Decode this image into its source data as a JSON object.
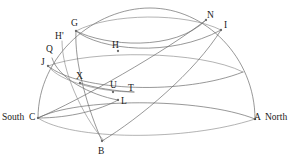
{
  "figure": {
    "background_color": "#ffffff",
    "stroke_color": "#6b6b6b",
    "label_color": "#1a1a1a",
    "width": 295,
    "height": 166
  },
  "cardinal_labels": [
    {
      "id": "south",
      "text": "South",
      "x": 2,
      "y": 113
    },
    {
      "id": "north",
      "text": "North",
      "x": 265,
      "y": 113
    }
  ],
  "point_labels": [
    {
      "id": "G",
      "text": "G",
      "x": 71,
      "y": 19
    },
    {
      "id": "N",
      "text": "N",
      "x": 207,
      "y": 11
    },
    {
      "id": "I",
      "text": "I",
      "x": 224,
      "y": 21
    },
    {
      "id": "Hp",
      "text": "H'",
      "x": 55,
      "y": 32
    },
    {
      "id": "H",
      "text": "H",
      "x": 112,
      "y": 41
    },
    {
      "id": "Q",
      "text": "Q",
      "x": 46,
      "y": 45
    },
    {
      "id": "J",
      "text": "J",
      "x": 41,
      "y": 58
    },
    {
      "id": "X",
      "text": "X",
      "x": 76,
      "y": 72
    },
    {
      "id": "U",
      "text": "U",
      "x": 110,
      "y": 81
    },
    {
      "id": "T",
      "text": "T",
      "x": 128,
      "y": 84
    },
    {
      "id": "L",
      "text": "L",
      "x": 121,
      "y": 97
    },
    {
      "id": "C",
      "text": "C",
      "x": 29,
      "y": 113
    },
    {
      "id": "A",
      "text": "A",
      "x": 254,
      "y": 113
    },
    {
      "id": "B",
      "text": "B",
      "x": 98,
      "y": 147
    }
  ],
  "node_dots": [
    {
      "id": "dot-G",
      "cx": 76,
      "cy": 31
    },
    {
      "id": "dot-N",
      "cx": 206,
      "cy": 20
    },
    {
      "id": "dot-I",
      "cx": 221,
      "cy": 30
    },
    {
      "id": "dot-H",
      "cx": 118,
      "cy": 51
    },
    {
      "id": "dot-X",
      "cx": 80,
      "cy": 83
    },
    {
      "id": "dot-U",
      "cx": 113,
      "cy": 92
    },
    {
      "id": "dot-L",
      "cx": 118,
      "cy": 100
    },
    {
      "id": "dot-B",
      "cx": 102,
      "cy": 141
    },
    {
      "id": "dot-C",
      "cx": 38,
      "cy": 118
    },
    {
      "id": "dot-A",
      "cx": 255,
      "cy": 119
    },
    {
      "id": "dot-J",
      "cx": 48,
      "cy": 66
    }
  ],
  "arcs": [
    {
      "id": "dome-outer",
      "d": "M 38 118 C 38 55 95 8 150 8 C 205 8 255 57 255 119"
    },
    {
      "id": "horizon-front",
      "d": "M 38 118 C 70 140 185 142 255 119"
    },
    {
      "id": "horizon-back",
      "d": "M 38 118 C 75 98 200 97 255 119"
    },
    {
      "id": "ellipse-GHN-front",
      "d": "M 76 31 C 100 50 170 58 221 30"
    },
    {
      "id": "ellipse-GHN-back",
      "d": "M 76 31 C 110 13 185 12 221 30"
    },
    {
      "id": "ellipse-upper-front",
      "d": "M 76 31 C 105 46 175 52 206 20"
    },
    {
      "id": "band-mid-front",
      "d": "M 48 66 C 80 92 185 95 243 72"
    },
    {
      "id": "band-mid-back",
      "d": "M 48 66 C 90 50 200 50 243 72"
    },
    {
      "id": "meridian-GB",
      "d": "M 76 31 C 74 62 88 110 102 141"
    },
    {
      "id": "meridian-QL",
      "d": "M 52 58 C 58 78 90 95 118 100"
    },
    {
      "id": "meridian-JT",
      "d": "M 48 66 C 60 82 100 92 134 92"
    },
    {
      "id": "great-circle-CN",
      "d": "M 38 118 C 80 100 165 52 206 20"
    },
    {
      "id": "great-circle-BI",
      "d": "M 102 141 C 140 118 195 72 221 30"
    },
    {
      "id": "great-circle-HpX",
      "d": "M 62 41 C 62 70 80 112 104 141"
    },
    {
      "id": "arc-X-U-T",
      "d": "M 80 83 C 95 88 115 91 134 92"
    },
    {
      "id": "arc-L-down",
      "d": "M 118 100 C 100 110 70 118 38 118"
    }
  ]
}
